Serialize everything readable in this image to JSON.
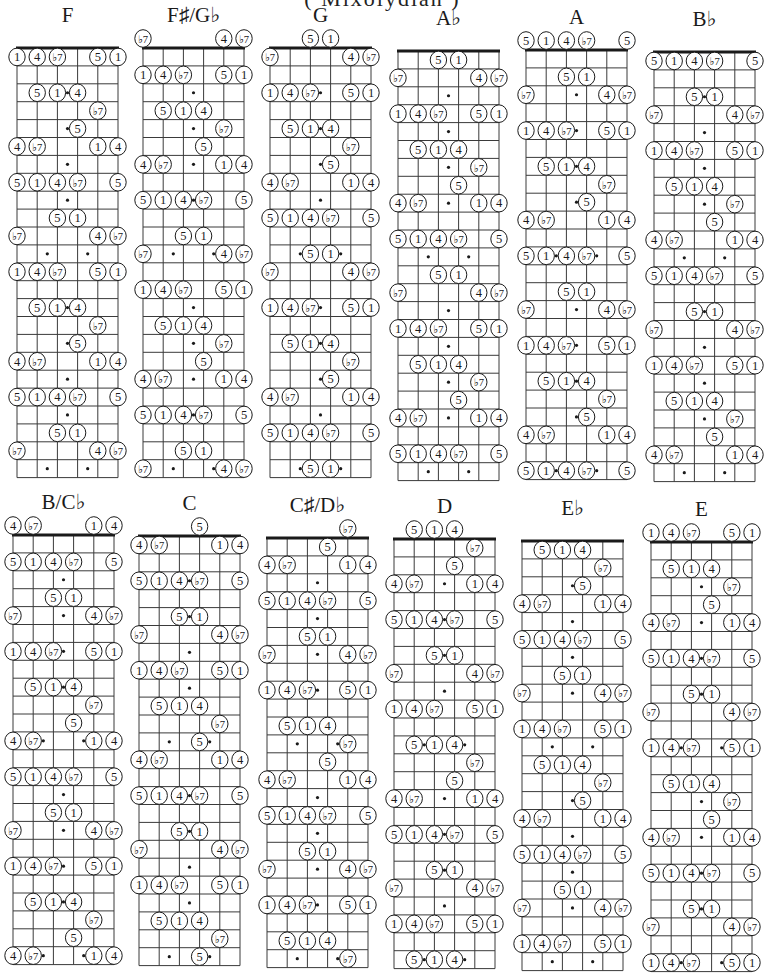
{
  "page": {
    "title": "( Mixolydian )",
    "title_partially_visible": true
  },
  "legend": {
    "string_order_left_to_right": [
      "E",
      "A",
      "D",
      "G",
      "B",
      "E"
    ],
    "degree_labels": {
      "1": "1",
      "4": "4",
      "5": "5",
      "b7": "♭7"
    },
    "single_marker_frets": [
      3,
      5,
      7,
      9,
      15,
      17,
      19,
      21
    ],
    "double_marker_frets": [
      12,
      24
    ],
    "frets_shown": 24
  },
  "charts": [
    {
      "key": "F",
      "x": 17,
      "nut_y": 48,
      "rows": [
        ",,,,,",
        "1,4,b7,,5,1",
        ",,,,,",
        ",5,1,4,,",
        ",,,,b7,",
        ",,,5,,",
        "4,b7,,,1,4",
        ",,,,,",
        "5,1,4,b7,,5",
        ",,,,,",
        ",,5,1,,",
        "b7,,,,4,b7",
        ",,,,,",
        "1,4,b7,,5,1",
        ",,,,,",
        ",5,1,4,,",
        ",,,,b7,",
        ",,,5,,",
        "4,b7,,,1,4",
        ",,,,,",
        "5,1,4,b7,,5",
        ",,,,,",
        ",,5,1,,",
        "b7,,,,4,b7",
        ",,,,,"
      ]
    },
    {
      "key": "F♯/G♭",
      "x": 143,
      "nut_y": 48,
      "rows": [
        "b7,,,,4,b7",
        ",,,,,",
        "1,4,b7,,5,1",
        ",,,,,",
        ",5,1,4,,",
        ",,,,b7,",
        ",,,5,,",
        "4,b7,,,1,4",
        ",,,,,",
        "5,1,4,b7,,5",
        ",,,,,",
        ",,5,1,,",
        "b7,,,,4,b7",
        ",,,,,",
        "1,4,b7,,5,1",
        ",,,,,",
        ",5,1,4,,",
        ",,,,b7,",
        ",,,5,,",
        "4,b7,,,1,4",
        ",,,,,",
        "5,1,4,b7,,5",
        ",,,,,",
        ",,5,1,,",
        "b7,,,,4,b7"
      ]
    },
    {
      "key": "G",
      "x": 270,
      "nut_y": 48,
      "rows": [
        ",,5,1,,",
        "b7,,,,4,b7",
        ",,,,,",
        "1,4,b7,,5,1",
        ",,,,,",
        ",5,1,4,,",
        ",,,,b7,",
        ",,,5,,",
        "4,b7,,,1,4",
        ",,,,,",
        "5,1,4,b7,,5",
        ",,,,,",
        ",,5,1,,",
        "b7,,,,4,b7",
        ",,,,,",
        "1,4,b7,,5,1",
        ",,,,,",
        ",5,1,4,,",
        ",,,,b7,",
        ",,,5,,",
        "4,b7,,,1,4",
        ",,,,,",
        "5,1,4,b7,,5",
        ",,,,,",
        ",,5,1,,"
      ]
    },
    {
      "key": "A♭",
      "x": 398,
      "nut_y": 51,
      "rows": [
        ",,,,,",
        ",,5,1,,",
        "b7,,,,4,b7",
        ",,,,,",
        "1,4,b7,,5,1",
        ",,,,,",
        ",5,1,4,,",
        ",,,,b7,",
        ",,,5,,",
        "4,b7,,,1,4",
        ",,,,,",
        "5,1,4,b7,,5",
        ",,,,,",
        ",,5,1,,",
        "b7,,,,4,b7",
        ",,,,,",
        "1,4,b7,,5,1",
        ",,,,,",
        ",5,1,4,,",
        ",,,,b7,",
        ",,,5,,",
        "4,b7,,,1,4",
        ",,,,,",
        "5,1,4,b7,,5",
        ",,,,,"
      ]
    },
    {
      "key": "A",
      "x": 526,
      "nut_y": 50,
      "rows": [
        "5,1,4,b7,,5",
        ",,,,,",
        ",,5,1,,",
        "b7,,,,4,b7",
        ",,,,,",
        "1,4,b7,,5,1",
        ",,,,,",
        ",5,1,4,,",
        ",,,,b7,",
        ",,,5,,",
        "4,b7,,,1,4",
        ",,,,,",
        "5,1,4,b7,,5",
        ",,,,,",
        ",,5,1,,",
        "b7,,,,4,b7",
        ",,,,,",
        "1,4,b7,,5,1",
        ",,,,,",
        ",5,1,4,,",
        ",,,,b7,",
        ",,,5,,",
        "4,b7,,,1,4",
        ",,,,,",
        "5,1,4,b7,,5"
      ]
    },
    {
      "key": "B♭",
      "x": 654,
      "nut_y": 52,
      "rows": [
        ",,,,,",
        "5,1,4,b7,,5",
        ",,,,,",
        ",,5,1,,",
        "b7,,,,4,b7",
        ",,,,,",
        "1,4,b7,,5,1",
        ",,,,,",
        ",5,1,4,,",
        ",,,,b7,",
        ",,,5,,",
        "4,b7,,,1,4",
        ",,,,,",
        "5,1,4,b7,,5",
        ",,,,,",
        ",,5,1,,",
        "b7,,,,4,b7",
        ",,,,,",
        "1,4,b7,,5,1",
        ",,,,,",
        ",5,1,4,,",
        ",,,,b7,",
        ",,,5,,",
        "4,b7,,,1,4",
        ",,,,,"
      ]
    },
    {
      "key": "B/C♭",
      "x": 13,
      "nut_y": 535,
      "rows": [
        "4,b7,,,1,4",
        ",,,,,",
        "5,1,4,b7,,5",
        ",,,,,",
        ",,5,1,,",
        "b7,,,,4,b7",
        ",,,,,",
        "1,4,b7,,5,1",
        ",,,,,",
        ",5,1,4,,",
        ",,,,b7,",
        ",,,5,,",
        "4,b7,,,1,4",
        ",,,,,",
        "5,1,4,b7,,5",
        ",,,,,",
        ",,5,1,,",
        "b7,,,,4,b7",
        ",,,,,",
        "1,4,b7,,5,1",
        ",,,,,",
        ",5,1,4,,",
        ",,,,b7,",
        ",,,5,,",
        "4,b7,,,1,4"
      ]
    },
    {
      "key": "C",
      "x": 139,
      "nut_y": 536,
      "rows": [
        ",,,5,,",
        "4,b7,,,1,4",
        ",,,,,",
        "5,1,4,b7,,5",
        ",,,,,",
        ",,5,1,,",
        "b7,,,,4,b7",
        ",,,,,",
        "1,4,b7,,5,1",
        ",,,,,",
        ",5,1,4,,",
        ",,,,b7,",
        ",,,5,,",
        "4,b7,,,1,4",
        ",,,,,",
        "5,1,4,b7,,5",
        ",,,,,",
        ",,5,1,,",
        "b7,,,,4,b7",
        ",,,,,",
        "1,4,b7,,5,1",
        ",,,,,",
        ",5,1,4,,",
        ",,,,b7,",
        ",,,5,,"
      ]
    },
    {
      "key": "C♯/D♭",
      "x": 267,
      "nut_y": 538,
      "rows": [
        ",,,,b7,",
        ",,,5,,",
        "4,b7,,,1,4",
        ",,,,,",
        "5,1,4,b7,,5",
        ",,,,,",
        ",,5,1,,",
        "b7,,,,4,b7",
        ",,,,,",
        "1,4,b7,,5,1",
        ",,,,,",
        ",5,1,4,,",
        ",,,,b7,",
        ",,,5,,",
        "4,b7,,,1,4",
        ",,,,,",
        "5,1,4,b7,,5",
        ",,,,,",
        ",,5,1,,",
        "b7,,,,4,b7",
        ",,,,,",
        "1,4,b7,,5,1",
        ",,,,,",
        ",5,1,4,,",
        ",,,,b7,"
      ]
    },
    {
      "key": "D",
      "x": 394,
      "nut_y": 539,
      "rows": [
        ",5,1,4,,",
        ",,,,b7,",
        ",,,5,,",
        "4,b7,,,1,4",
        ",,,,,",
        "5,1,4,b7,,5",
        ",,,,,",
        ",,5,1,,",
        "b7,,,,4,b7",
        ",,,,,",
        "1,4,b7,,5,1",
        ",,,,,",
        ",5,1,4,,",
        ",,,,b7,",
        ",,,5,,",
        "4,b7,,,1,4",
        ",,,,,",
        "5,1,4,b7,,5",
        ",,,,,",
        ",,5,1,,",
        "b7,,,,4,b7",
        ",,,,,",
        "1,4,b7,,5,1",
        ",,,,,",
        ",5,1,4,,"
      ]
    },
    {
      "key": "E♭",
      "x": 522,
      "nut_y": 541,
      "rows": [
        ",,,,,",
        ",5,1,4,,",
        ",,,,b7,",
        ",,,5,,",
        "4,b7,,,1,4",
        ",,,,,",
        "5,1,4,b7,,5",
        ",,,,,",
        ",,5,1,,",
        "b7,,,,4,b7",
        ",,,,,",
        "1,4,b7,,5,1",
        ",,,,,",
        ",5,1,4,,",
        ",,,,b7,",
        ",,,5,,",
        "4,b7,,,1,4",
        ",,,,,",
        "5,1,4,b7,,5",
        ",,,,,",
        ",,5,1,,",
        "b7,,,,4,b7",
        ",,,,,",
        "1,4,b7,,5,1",
        ",,,,,"
      ]
    },
    {
      "key": "E",
      "x": 651,
      "nut_y": 542,
      "rows": [
        "1,4,b7,,5,1",
        ",,,,,",
        ",5,1,4,,",
        ",,,,b7,",
        ",,,5,,",
        "4,b7,,,1,4",
        ",,,,,",
        "5,1,4,b7,,5",
        ",,,,,",
        ",,5,1,,",
        "b7,,,,4,b7",
        ",,,,,",
        "1,4,b7,,5,1",
        ",,,,,",
        ",5,1,4,,",
        ",,,,b7,",
        ",,,5,,",
        "4,b7,,,1,4",
        ",,,,,",
        "5,1,4,b7,,5",
        ",,,,,",
        ",,5,1,,",
        "b7,,,,4,b7",
        ",,,,,",
        "1,4,b7,,5,1"
      ]
    }
  ],
  "colors": {
    "ink": "#1a1a1a",
    "paper": "#ffffff",
    "grid": "#3a3a3a"
  }
}
